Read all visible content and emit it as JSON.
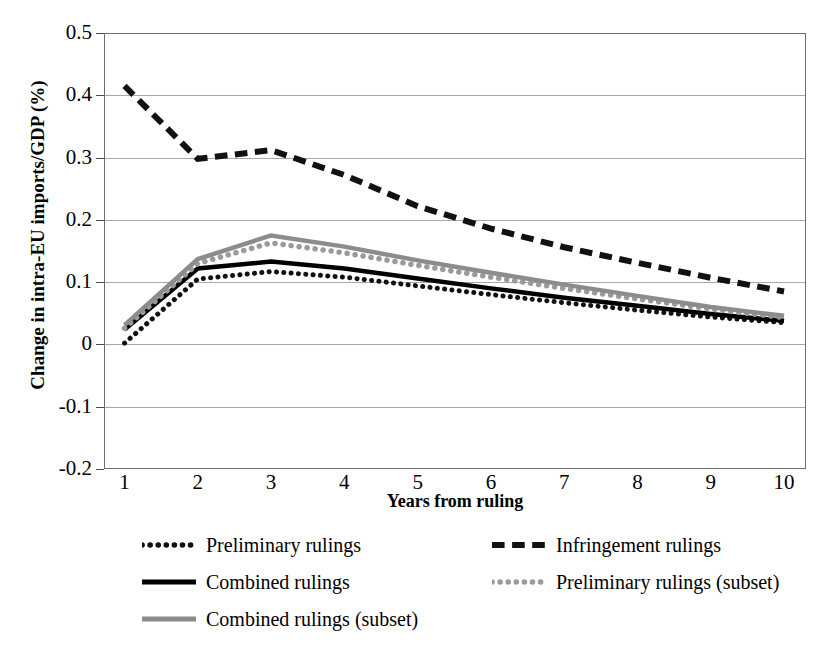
{
  "chart_data": {
    "type": "line",
    "title": "",
    "xlabel": "Years from ruling",
    "ylabel": "Change in intra-EU imports/GDP (%)",
    "x": [
      1,
      2,
      3,
      4,
      5,
      6,
      7,
      8,
      9,
      10
    ],
    "xtick_labels": [
      "1",
      "2",
      "3",
      "4",
      "5",
      "6",
      "7",
      "8",
      "9",
      "10"
    ],
    "ytick_labels": [
      "0.5",
      "0.4",
      "0.3",
      "0.2",
      "0.1",
      "0",
      "-0.1",
      "-0.2"
    ],
    "ytick_values": [
      0.5,
      0.4,
      0.3,
      0.2,
      0.1,
      0,
      -0.1,
      -0.2
    ],
    "xlim": [
      0.72,
      10.3
    ],
    "ylim": [
      -0.2,
      0.5
    ],
    "grid": "horizontal",
    "legend_position": "below-plot",
    "series": [
      {
        "name": "Preliminary rulings",
        "style": "dotted",
        "color": "#111111",
        "values": [
          0.002,
          0.105,
          0.117,
          0.108,
          0.094,
          0.08,
          0.067,
          0.055,
          0.044,
          0.035
        ]
      },
      {
        "name": "Infringement rulings",
        "style": "dashed",
        "color": "#111111",
        "values": [
          0.415,
          0.298,
          0.312,
          0.272,
          0.222,
          0.186,
          0.156,
          0.131,
          0.107,
          0.085
        ]
      },
      {
        "name": "Combined rulings",
        "style": "solid",
        "color": "#000000",
        "values": [
          0.024,
          0.122,
          0.133,
          0.122,
          0.106,
          0.09,
          0.075,
          0.062,
          0.049,
          0.038
        ]
      },
      {
        "name": "Preliminary rulings (subset)",
        "style": "dotted",
        "color": "#9a9a9a",
        "values": [
          0.026,
          0.13,
          0.163,
          0.147,
          0.127,
          0.108,
          0.09,
          0.073,
          0.057,
          0.043
        ]
      },
      {
        "name": "Combined rulings (subset)",
        "style": "solid",
        "color": "#8c8c8c",
        "values": [
          0.031,
          0.137,
          0.175,
          0.157,
          0.135,
          0.115,
          0.096,
          0.078,
          0.06,
          0.046
        ]
      }
    ]
  },
  "legend": {
    "items": [
      {
        "label": "Preliminary rulings",
        "style": "dotted",
        "color": "#111111"
      },
      {
        "label": "Infringement rulings",
        "style": "dashed",
        "color": "#111111"
      },
      {
        "label": "Combined rulings",
        "style": "solid",
        "color": "#000000"
      },
      {
        "label": "Preliminary rulings (subset)",
        "style": "dotted",
        "color": "#9a9a9a"
      },
      {
        "label": "Combined rulings (subset)",
        "style": "solid",
        "color": "#8c8c8c"
      }
    ]
  }
}
